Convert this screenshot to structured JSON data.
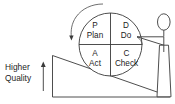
{
  "diagram": {
    "colors": {
      "stroke": "#3a3a3a",
      "text": "#1c1c1c",
      "background": "#ffffff"
    },
    "wheel": {
      "name": "pdca-wheel",
      "quadrants": [
        {
          "position": "top-left",
          "letter": "P",
          "word": "Plan"
        },
        {
          "position": "top-right",
          "letter": "D",
          "word": "Do"
        },
        {
          "position": "bottom-left",
          "letter": "A",
          "word": "Act"
        },
        {
          "position": "bottom-right",
          "letter": "C",
          "word": "Check"
        }
      ]
    },
    "rotation_arrow": {
      "name": "counterclockwise-rotation-arrow",
      "direction": "counterclockwise"
    },
    "axis": {
      "name": "higher-quality-arrow",
      "direction": "up",
      "label_line_1": "Higher",
      "label_line_2": "Quality"
    },
    "ramp": {
      "name": "inclined-ramp"
    },
    "person": {
      "name": "person-pushing-wheel"
    }
  }
}
